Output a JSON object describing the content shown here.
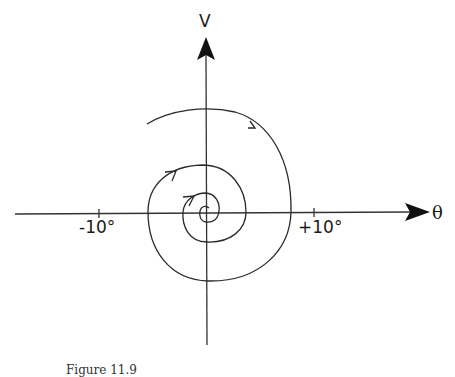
{
  "figure": {
    "caption": "Figure 11.9",
    "axes": {
      "vertical_label": "V",
      "horizontal_label": "θ",
      "ticks": [
        {
          "label": "-10°",
          "value": -10
        },
        {
          "label": "+10°",
          "value": 10
        }
      ]
    },
    "curve": {
      "type": "inward spiral (stable focus)",
      "direction": "clockwise, converging to origin",
      "arrow_count": 3
    },
    "colors": {
      "line": "#2a2a2a",
      "background": "#ffffff"
    }
  }
}
